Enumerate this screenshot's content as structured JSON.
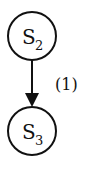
{
  "diagram": {
    "nodes": [
      {
        "id": "S2",
        "base": "S",
        "sub": "2",
        "cx": 32,
        "cy": 36,
        "r": 24
      },
      {
        "id": "S3",
        "base": "S",
        "sub": "3",
        "cx": 32,
        "cy": 131,
        "r": 24
      }
    ],
    "edges": [
      {
        "from": "S2",
        "to": "S3",
        "label": "(1)",
        "directed": true
      }
    ],
    "colors": {
      "stroke": "#111111",
      "background": "#ffffff"
    }
  }
}
